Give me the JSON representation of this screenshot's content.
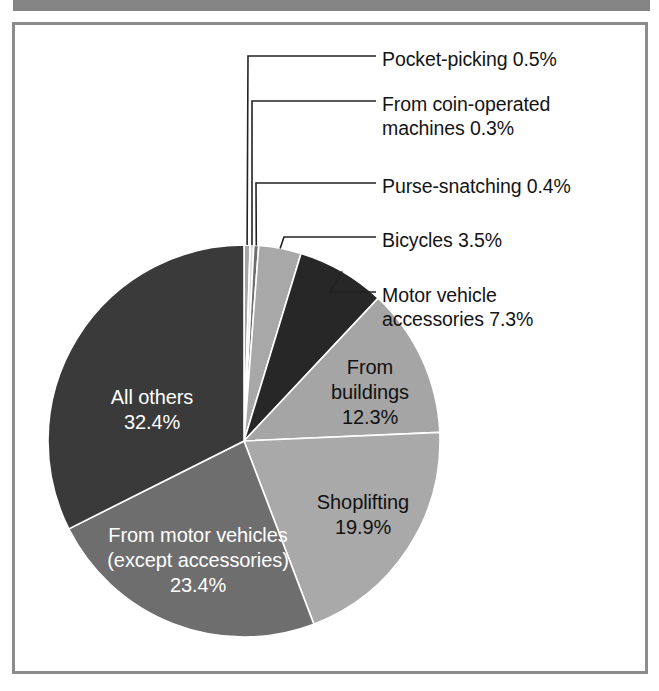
{
  "figure": {
    "background_color": "#ffffff",
    "frame_color": "#8c8c8c",
    "scan_bar_color": "#848484"
  },
  "chart_data": {
    "type": "pie",
    "title": "",
    "subtitle": "",
    "xlabel": "",
    "ylabel": "",
    "legend_position": "none",
    "grid": false,
    "units": "percent",
    "total": 100,
    "start_angle_deg": 0,
    "direction": "clockwise",
    "categories": [
      "Pocket-picking",
      "From coin-operated machines",
      "Purse-snatching",
      "Bicycles",
      "Motor vehicle accessories",
      "From buildings",
      "Shoplifting",
      "From motor vehicles (except accessories)",
      "All others"
    ],
    "values": [
      0.5,
      0.3,
      0.4,
      3.5,
      7.3,
      12.3,
      19.9,
      23.4,
      32.4
    ],
    "slices": [
      {
        "name": "Pocket-picking",
        "value": 0.5,
        "value_text": "0.5%",
        "label_text": "Pocket-picking 0.5%",
        "color": "#a5a5a5",
        "label_mode": "callout"
      },
      {
        "name": "From coin-operated machines",
        "value": 0.3,
        "value_text": "0.3%",
        "label_line_1": "From coin-operated",
        "label_line_2": "machines 0.3%",
        "color": "#dcdcdc",
        "label_mode": "callout"
      },
      {
        "name": "Purse-snatching",
        "value": 0.4,
        "value_text": "0.4%",
        "label_text": "Purse-snatching 0.4%",
        "color": "#6e6e6e",
        "label_mode": "callout"
      },
      {
        "name": "Bicycles",
        "value": 3.5,
        "value_text": "3.5%",
        "label_text": "Bicycles 3.5%",
        "color": "#a8a8a8",
        "label_mode": "callout"
      },
      {
        "name": "Motor vehicle accessories",
        "value": 7.3,
        "value_text": "7.3%",
        "label_line_1": "Motor vehicle",
        "label_line_2": "accessories 7.3%",
        "color": "#272727",
        "label_mode": "callout"
      },
      {
        "name": "From buildings",
        "value": 12.3,
        "value_text": "12.3%",
        "label_line_1": "From",
        "label_line_2": "buildings",
        "label_line_3": "12.3%",
        "color": "#a5a5a5",
        "label_mode": "inside",
        "label_color": "dark"
      },
      {
        "name": "Shoplifting",
        "value": 19.9,
        "value_text": "19.9%",
        "label_line_1": "Shoplifting",
        "label_line_2": "19.9%",
        "color": "#a9a9a9",
        "label_mode": "inside",
        "label_color": "dark"
      },
      {
        "name": "From motor vehicles (except accessories)",
        "value": 23.4,
        "value_text": "23.4%",
        "label_line_1": "From motor vehicles",
        "label_line_2": "(except accessories)",
        "label_line_3": "23.4%",
        "color": "#6e6e6e",
        "label_mode": "inside",
        "label_color": "light"
      },
      {
        "name": "All others",
        "value": 32.4,
        "value_text": "32.4%",
        "label_line_1": "All others",
        "label_line_2": "32.4%",
        "color": "#3a3a3a",
        "label_mode": "inside",
        "label_color": "light"
      }
    ]
  }
}
